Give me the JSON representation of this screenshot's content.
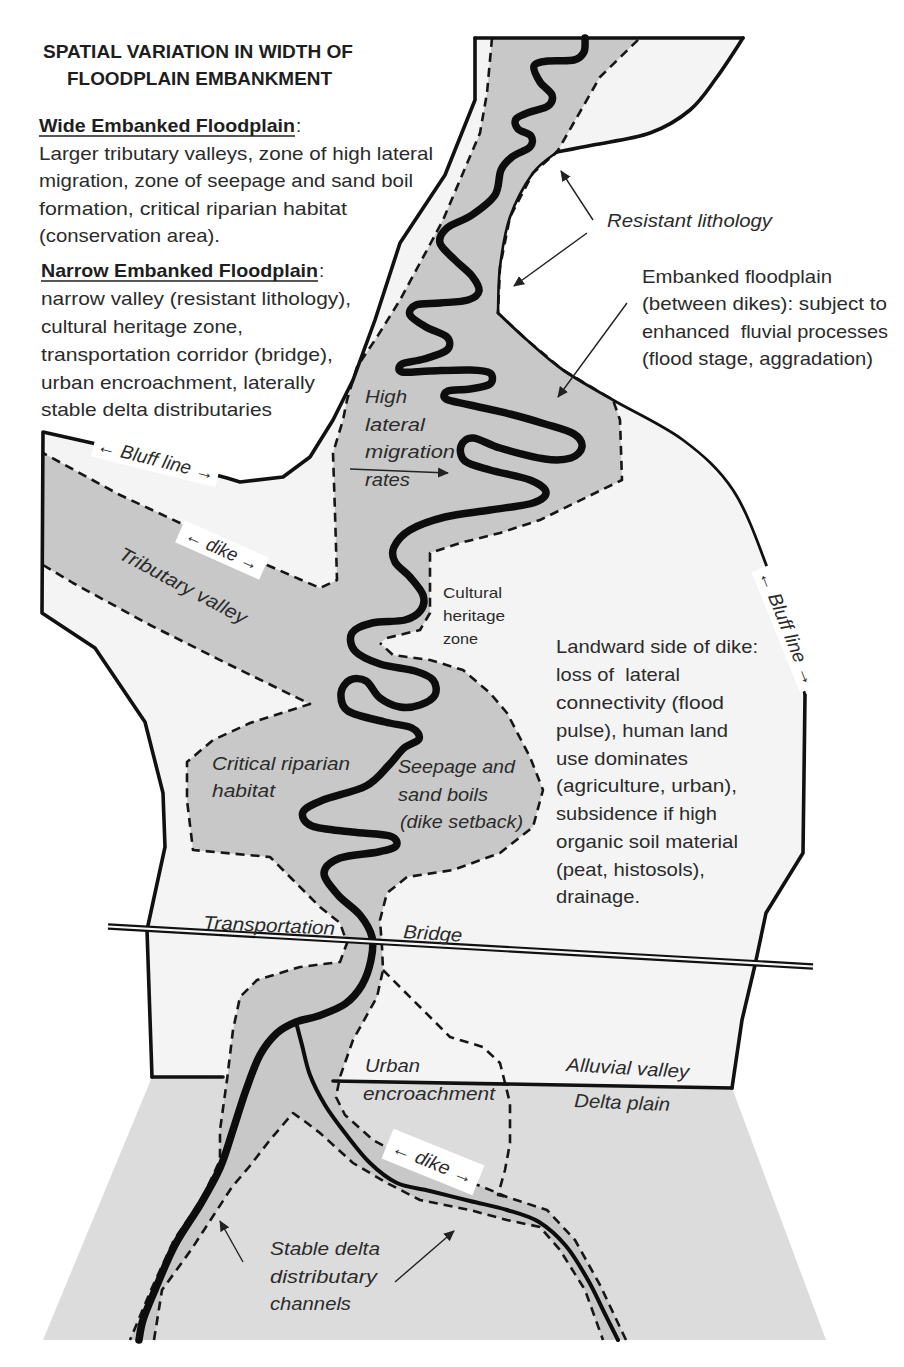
{
  "title": {
    "line1": "SPATIAL VARIATION IN WIDTH OF",
    "line2": "FLOODPLAIN EMBANKMENT"
  },
  "wide_floodplain": {
    "heading": "Wide Embanked Floodplain",
    "colon": ":",
    "lines": [
      "Larger tributary valleys, zone of high lateral",
      "migration, zone of seepage and sand boil",
      "formation, critical riparian habitat",
      "(conservation area)."
    ]
  },
  "narrow_floodplain": {
    "heading": "Narrow Embanked Floodplain",
    "colon": ":",
    "lines": [
      "narrow valley (resistant lithology),",
      "cultural heritage zone,",
      "transportation corridor (bridge),",
      "urban encroachment, laterally",
      "stable delta distributaries"
    ]
  },
  "annotations": {
    "resistant_lithology": "Resistant lithology",
    "embanked_floodplain": [
      "Embanked floodplain",
      "(between dikes): subject to",
      "enhanced  fluvial processes",
      "(flood stage, aggradation)"
    ],
    "landward_side": [
      "Landward side of dike:",
      "loss of  lateral",
      "connectivity (flood",
      "pulse), human land",
      "use dominates",
      "(agriculture, urban),",
      "subsidence if high",
      "organic soil material",
      "(peat, histosols),",
      "drainage."
    ],
    "cultural_heritage": [
      "Cultural",
      "heritage",
      "zone"
    ],
    "high_lateral_migration": [
      "High",
      "lateral",
      "migration",
      "rates"
    ],
    "critical_riparian": [
      "Critical riparian",
      "habitat"
    ],
    "seepage": [
      "Seepage and",
      "sand boils",
      "(dike setback)"
    ],
    "tributary_valley": "Tributary valley",
    "transportation": "Transportation",
    "bridge": "Bridge",
    "urban_encroachment": [
      "Urban",
      "encroachment"
    ],
    "alluvial_valley": "Alluvial valley",
    "delta_plain": "Delta plain",
    "stable_delta": [
      "Stable delta",
      "distributary",
      "channels"
    ]
  },
  "labels": {
    "bluff_line_left": "← Bluff line →",
    "dike_upper": "← dike →",
    "bluff_line_right": "← Bluff line →",
    "dike_lower": "← dike →"
  },
  "colors": {
    "embanked_floodplain": "#c8c8c8",
    "alluvial_valley": "#f4f4f4",
    "delta_plain": "#dcdcdc",
    "river": "#0d0d0d",
    "outside": "#ffffff"
  }
}
